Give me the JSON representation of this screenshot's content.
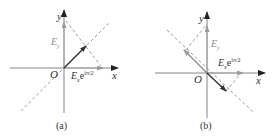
{
  "figure": {
    "panels": [
      {
        "id": "a",
        "caption": "(a)",
        "axis_x_label": "x",
        "axis_y_label": "y",
        "origin_label": "O",
        "ey_label_base": "E",
        "ey_label_sub": "y",
        "ex_label_base": "E",
        "ex_label_sub": "x",
        "ex_label_exp_base": "e",
        "ex_label_exp": "iπ/2",
        "resultant_direction": "first-third quadrant diagonal (45°)"
      },
      {
        "id": "b",
        "caption": "(b)",
        "axis_x_label": "x",
        "axis_y_label": "y",
        "origin_label": "O",
        "ey_label_base": "E",
        "ey_label_sub": "y",
        "ex_label_base": "E",
        "ex_label_sub": "x",
        "ex_label_exp_base": "e",
        "ex_label_exp": "iπ/2",
        "resultant_direction": "second-fourth quadrant diagonal (-45°)"
      }
    ],
    "colors": {
      "axis": "#555555",
      "component_vector": "#999999",
      "resultant_vector": "#444444",
      "dashed": "#888888",
      "label_gray": "#8a8a8a",
      "label_dark": "#333333"
    }
  }
}
